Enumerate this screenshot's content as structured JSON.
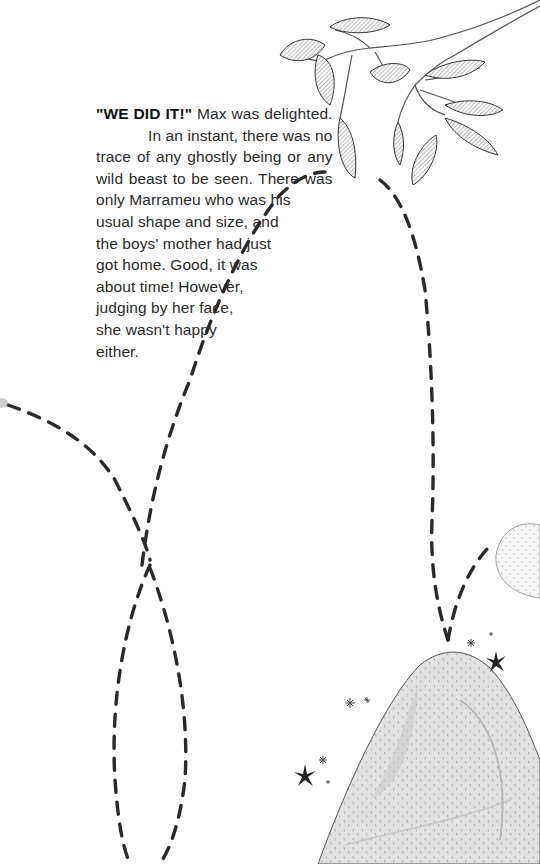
{
  "page": {
    "background": "#ffffff",
    "ink_color": "#2a2a2a"
  },
  "story": {
    "exclamation": "\"WE DID IT!\"",
    "lines": [
      " Max was delighted.",
      "In an instant, there was no",
      "trace of any ghostly being or any",
      "wild beast to be seen. There was",
      "only Marrameu who was his",
      "usual shape and size, and",
      "the boys' mother had just",
      "got home. Good, it was",
      "about time! However,",
      "judging by her face,",
      "she wasn't happy",
      "either."
    ]
  },
  "illustration": {
    "elements": [
      {
        "name": "tree-branch-with-leaves",
        "position": "top-right"
      },
      {
        "name": "dashed-flight-path",
        "description": "looping dashed trail"
      },
      {
        "name": "dotted-mound",
        "position": "bottom-right"
      },
      {
        "name": "dotted-stone",
        "position": "right-edge"
      },
      {
        "name": "sparkle-stars",
        "count": 8
      }
    ]
  }
}
